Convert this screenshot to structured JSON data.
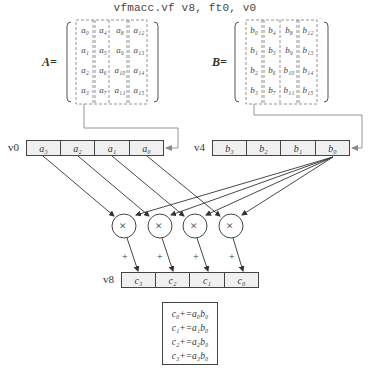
{
  "title": "vfmacc.vf v8, ft0, v0",
  "matrix_a": {
    "label": "A=",
    "cells": [
      [
        "a₀",
        "a₄",
        "a₈",
        "a₁₂"
      ],
      [
        "a₁",
        "a₅",
        "a₉",
        "a₁₃"
      ],
      [
        "a₂",
        "a₆",
        "a₁₀",
        "a₁₄"
      ],
      [
        "a₃",
        "a₇",
        "a₁₁",
        "a₁₅"
      ]
    ]
  },
  "matrix_b": {
    "label": "B=",
    "cells": [
      [
        "b₀",
        "b₄",
        "b₈",
        "b₁₂"
      ],
      [
        "b₁",
        "b₅",
        "b₉",
        "b₁₃"
      ],
      [
        "b₂",
        "b₆",
        "b₁₀",
        "b₁₄"
      ],
      [
        "b₃",
        "b₇",
        "b₁₁",
        "b₁₅"
      ]
    ]
  },
  "registers": {
    "v0": {
      "name": "v0",
      "cells": [
        "a₃",
        "a₂",
        "a₁",
        "a₀"
      ]
    },
    "v4": {
      "name": "v4",
      "cells": [
        "b₃",
        "b₂",
        "b₁",
        "b₀"
      ]
    },
    "v8": {
      "name": "v8",
      "cells": [
        "c₃",
        "c₂",
        "c₁",
        "c₀"
      ]
    }
  },
  "multipliers": {
    "symbol": "×",
    "count": 4
  },
  "accumulate_symbol": "+",
  "equations": [
    "c₀+=a₀b₀",
    "c₁+=a₁b₀",
    "c₂+=a₂b₀",
    "c₃+=a₃b₀"
  ],
  "colors": {
    "line": "#444444",
    "cell_fill": "#f0f0f0",
    "dashed": "#777777"
  }
}
